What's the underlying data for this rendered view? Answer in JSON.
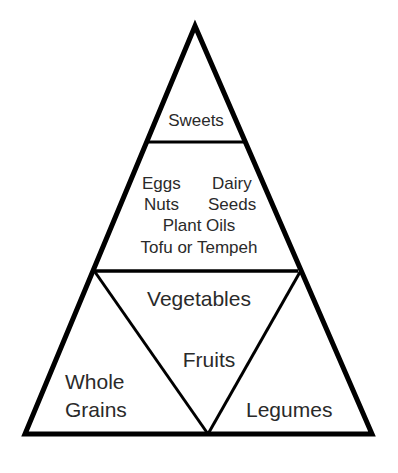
{
  "diagram": {
    "type": "food-pyramid",
    "colors": {
      "stroke": "#000000",
      "text": "#2a2a2a",
      "background": "#ffffff"
    },
    "tiers": {
      "top": {
        "label": "Sweets"
      },
      "middle": {
        "items": {
          "eggs": "Eggs",
          "dairy": "Dairy",
          "nuts": "Nuts",
          "seeds": "Seeds",
          "plant_oils": "Plant Oils",
          "tofu": "Tofu or Tempeh"
        }
      },
      "bottom": {
        "center_inverted": {
          "vegetables": "Vegetables",
          "fruits": "Fruits"
        },
        "left": {
          "line1": "Whole",
          "line2": "Grains"
        },
        "right": {
          "label": "Legumes"
        }
      }
    }
  }
}
